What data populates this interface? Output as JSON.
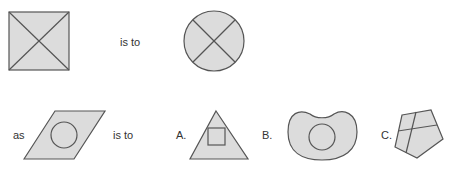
{
  "question": {
    "row1": {
      "connector": "is to",
      "shape1": "square-with-diagonals",
      "shape2": "circle-with-cross"
    },
    "row2": {
      "prefix": "as",
      "connector": "is to",
      "shape3": "parallelogram-with-circle"
    }
  },
  "options": [
    {
      "label": "A.",
      "shape": "triangle-with-square"
    },
    {
      "label": "B.",
      "shape": "kidney-with-circle"
    },
    {
      "label": "C.",
      "shape": "pentagon-with-cross"
    }
  ],
  "colors": {
    "fill": "#dcdcdc",
    "stroke": "#555555",
    "text": "#333333"
  }
}
